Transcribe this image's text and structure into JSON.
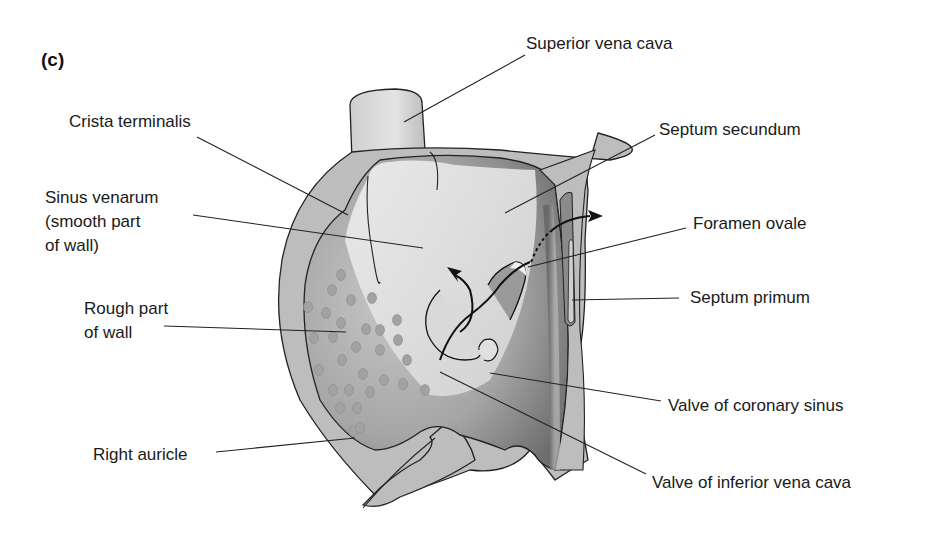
{
  "figure": {
    "panel_label": "(c)",
    "labels": {
      "superior_vena_cava": "Superior vena cava",
      "crista_terminalis": "Crista terminalis",
      "septum_secundum": "Septum secundum",
      "sinus_venarum_line1": "Sinus venarum",
      "sinus_venarum_line2": "(smooth part",
      "sinus_venarum_line3": "of wall)",
      "foramen_ovale": "Foramen ovale",
      "rough_part_line1": "Rough part",
      "rough_part_line2": "of wall",
      "septum_primum": "Septum primum",
      "valve_coronary_sinus": "Valve of coronary sinus",
      "right_auricle": "Right auricle",
      "valve_ivc": "Valve of inferior vena cava"
    },
    "colors": {
      "outer_wall": "#bdbdbd",
      "inner_dark": "#7a7a7a",
      "smooth_light": "#e2e2e2",
      "outline": "#222222",
      "background": "#ffffff"
    }
  }
}
